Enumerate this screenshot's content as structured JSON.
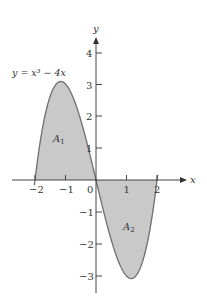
{
  "diagram": {
    "equation_label": "y = x³ − 4x",
    "function": "x^3 - 4x",
    "axes": {
      "x_label": "x",
      "y_label": "y",
      "x_ticks": [
        "−2",
        "−1",
        "0",
        "1",
        "2"
      ],
      "y_ticks_positive": [
        "1",
        "2",
        "3",
        "4"
      ],
      "y_ticks_negative": [
        "−1",
        "−2",
        "−3"
      ]
    },
    "regions": [
      {
        "label": "A",
        "subscript": "1",
        "interval": "[-2, 0]",
        "side": "above x-axis"
      },
      {
        "label": "A",
        "subscript": "2",
        "interval": "[0, 2]",
        "side": "below x-axis"
      }
    ],
    "colors": {
      "fill": "#c9c9c9",
      "curve": "#6e6e6e",
      "axis": "#444444",
      "text": "#333333"
    }
  }
}
